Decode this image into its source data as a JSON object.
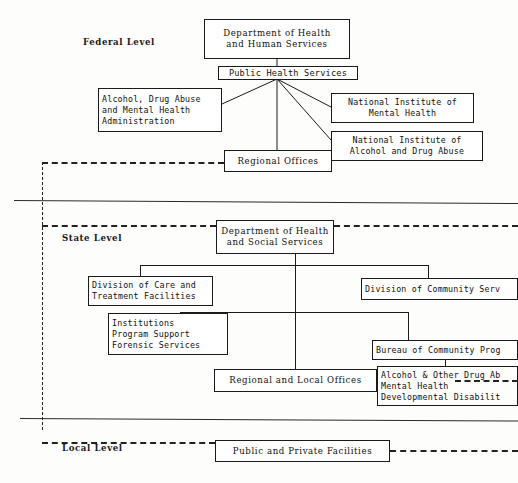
{
  "diagram": {
    "levels": [
      {
        "id": "federal",
        "label": "Federal Level"
      },
      {
        "id": "state",
        "label": "State Level"
      },
      {
        "id": "local",
        "label": "Local Level"
      }
    ]
  },
  "nodes": {
    "dhhs": {
      "lines": [
        "Department of Health",
        "and Human Services"
      ]
    },
    "phs": {
      "lines": [
        "Public Health Services"
      ]
    },
    "adamha": {
      "lines": [
        "Alcohol, Drug Abuse",
        "and Mental Health",
        "Administration"
      ]
    },
    "nimh": {
      "lines": [
        "National Institute of",
        "Mental Health"
      ]
    },
    "niada": {
      "lines": [
        "National Institute of",
        "Alcohol and Drug Abuse"
      ]
    },
    "regional_offices": {
      "lines": [
        "Regional Offices"
      ]
    },
    "dhss": {
      "lines": [
        "Department of Health",
        "and Social Services"
      ]
    },
    "div_care": {
      "lines": [
        "Division of Care and",
        "Treatment Facilities"
      ]
    },
    "div_community": {
      "lines": [
        "Division of Community Serv"
      ]
    },
    "institutions": {
      "lines": [
        "Institutions",
        "Program Support",
        "Forensic Services"
      ]
    },
    "bureau": {
      "lines": [
        "Bureau of Community Prog"
      ]
    },
    "programs": {
      "lines": [
        "Alcohol & Other Drug Ab",
        "Mental Health",
        "Developmental Disabilit"
      ]
    },
    "regional_local": {
      "lines": [
        "Regional and Local Offices"
      ]
    },
    "public_private": {
      "lines": [
        "Public and Private Facilities"
      ]
    }
  },
  "colors": {
    "ink": "#1a1a1a",
    "paper": "#fdfdfc",
    "rule": "#2b2b2b"
  }
}
